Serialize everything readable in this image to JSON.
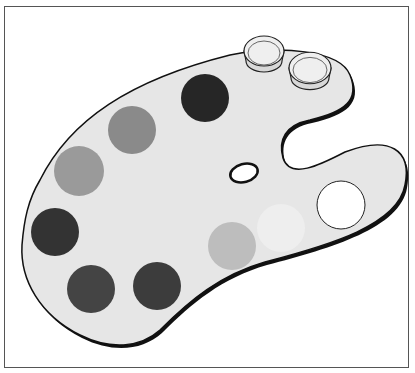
{
  "image": {
    "subject": "artist paint palette illustration",
    "colors": {
      "palette_fill": "#e6e6e6",
      "outline": "#111111",
      "background": "#ffffff",
      "frame": "#555555"
    },
    "paint_dabs": [
      {
        "cx": 205,
        "cy": 98,
        "r": 24,
        "fill": "#262626"
      },
      {
        "cx": 132,
        "cy": 130,
        "r": 24,
        "fill": "#8a8a8a"
      },
      {
        "cx": 79,
        "cy": 171,
        "r": 25,
        "fill": "#9a9a9a"
      },
      {
        "cx": 55,
        "cy": 232,
        "r": 24,
        "fill": "#333333"
      },
      {
        "cx": 91,
        "cy": 289,
        "r": 24,
        "fill": "#444444"
      },
      {
        "cx": 157,
        "cy": 286,
        "r": 24,
        "fill": "#3c3c3c"
      },
      {
        "cx": 232,
        "cy": 246,
        "r": 24,
        "fill": "#bdbdbd"
      },
      {
        "cx": 281,
        "cy": 228,
        "r": 24,
        "fill": "#eeeeee"
      },
      {
        "cx": 341,
        "cy": 205,
        "r": 24,
        "fill": "#ffffff",
        "stroke": "#222222"
      }
    ],
    "cups": [
      {
        "cx": 264,
        "cy": 55,
        "r": 20
      },
      {
        "cx": 310,
        "cy": 72,
        "r": 21
      }
    ]
  }
}
